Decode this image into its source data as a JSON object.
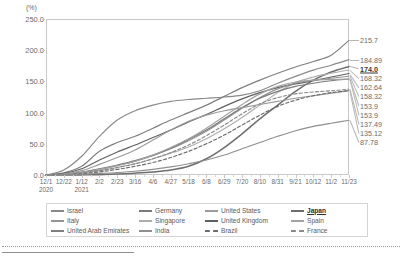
{
  "chart_data": {
    "type": "line",
    "title": "",
    "xlabel": "",
    "ylabel": "(%)",
    "yunit": "(%)",
    "ylim": [
      0,
      250
    ],
    "ytick_step": 50,
    "ytick_labels": [
      "250.0",
      "200.0",
      "150.0",
      "100.0",
      "50.0",
      "0.0"
    ],
    "ytick_values": [
      250,
      200,
      150,
      100,
      50,
      0
    ],
    "grid": false,
    "legend_position": "bottom",
    "x_start_year": "2020",
    "x_second_year": "2021",
    "x": [
      "12/1",
      "12/22",
      "1/12",
      "2/2",
      "2/23",
      "3/16",
      "4/6",
      "4/27",
      "5/18",
      "6/8",
      "6/29",
      "7/20",
      "8/10",
      "8/31",
      "9/21",
      "10/12",
      "11/2",
      "11/23"
    ],
    "xtick_labels": [
      "12/1",
      "12/22",
      "1/12",
      "2/2",
      "2/23",
      "3/16",
      "4/6",
      "4/27",
      "5/18",
      "6/8",
      "6/29",
      "7/20",
      "8/10",
      "8/31",
      "9/21",
      "10/12",
      "11/2",
      "11/23"
    ],
    "year_labels": [
      {
        "label": "2020",
        "at": "12/1"
      },
      {
        "label": "2021",
        "at": "1/12"
      }
    ],
    "series": [
      {
        "name": "United Arab Emirates",
        "end_value": 215.7,
        "end_label": "215.7",
        "color": "#7f7f7f",
        "dash": false,
        "highlight": false,
        "values": [
          0.0,
          3.5,
          14.0,
          38.0,
          52.0,
          62.0,
          75.0,
          88.0,
          100.0,
          112.0,
          126.0,
          140.0,
          152.0,
          163.0,
          173.0,
          182.0,
          192.0,
          215.7
        ]
      },
      {
        "name": "Israel",
        "end_value": 184.89,
        "end_label": "184.89",
        "color": "#898989",
        "dash": false,
        "highlight": false,
        "values": [
          0.0,
          8.0,
          30.0,
          62.0,
          88.0,
          103.0,
          112.0,
          118.0,
          121.0,
          123.0,
          125.0,
          128.0,
          135.0,
          147.0,
          158.0,
          168.0,
          176.0,
          184.89
        ]
      },
      {
        "name": "Japan",
        "end_value": 174.0,
        "end_label": "174.0",
        "color": "#6e6e6e",
        "dash": false,
        "highlight": true,
        "values": [
          0.0,
          0.0,
          0.2,
          0.6,
          1.5,
          3.0,
          5.0,
          8.0,
          14.0,
          26.0,
          44.0,
          66.0,
          90.0,
          112.0,
          134.0,
          152.0,
          165.0,
          174.0
        ]
      },
      {
        "name": "Singapore",
        "end_value": 168.32,
        "end_label": "168.32",
        "color": "#adadad",
        "dash": false,
        "highlight": false,
        "values": [
          0.0,
          1.0,
          3.0,
          7.0,
          12.0,
          18.0,
          26.0,
          35.0,
          45.0,
          58.0,
          74.0,
          92.0,
          112.0,
          132.0,
          148.0,
          157.0,
          163.0,
          168.32
        ]
      },
      {
        "name": "United Kingdom",
        "end_value": 162.64,
        "end_label": "162.64",
        "color": "#5f5f5f",
        "dash": false,
        "highlight": false,
        "values": [
          0.0,
          2.5,
          10.0,
          24.0,
          37.0,
          48.0,
          60.0,
          72.0,
          85.0,
          97.0,
          110.0,
          122.0,
          132.0,
          140.0,
          146.0,
          151.0,
          157.0,
          162.64
        ]
      },
      {
        "name": "Italy",
        "end_value": 158.32,
        "end_label": "158.32",
        "color": "#949494",
        "dash": false,
        "highlight": false,
        "values": [
          0.0,
          1.0,
          4.0,
          9.0,
          15.0,
          22.0,
          31.0,
          42.0,
          55.0,
          70.0,
          88.0,
          107.0,
          124.0,
          138.0,
          147.0,
          152.0,
          155.0,
          158.32
        ]
      },
      {
        "name": "Germany",
        "end_value": 153.9,
        "end_label": "153.9",
        "color": "#7a7a7a",
        "dash": false,
        "highlight": false,
        "values": [
          0.0,
          1.2,
          4.5,
          10.0,
          16.0,
          23.0,
          32.0,
          43.0,
          57.0,
          72.0,
          90.0,
          108.0,
          123.0,
          134.0,
          142.0,
          147.0,
          151.0,
          153.9
        ]
      },
      {
        "name": "Spain",
        "end_value": 153.9,
        "end_label": "153.9",
        "color": "#a2a2a2",
        "dash": false,
        "highlight": false,
        "values": [
          0.0,
          1.0,
          4.0,
          9.0,
          15.0,
          22.0,
          32.0,
          44.0,
          58.0,
          75.0,
          94.0,
          113.0,
          130.0,
          142.0,
          149.0,
          152.0,
          153.0,
          153.9
        ]
      },
      {
        "name": "France",
        "end_value": 137.49,
        "end_label": "137.49",
        "color": "#8a8a8a",
        "dash": true,
        "highlight": false,
        "values": [
          0.0,
          0.8,
          3.0,
          7.0,
          12.0,
          18.0,
          26.0,
          36.0,
          48.0,
          63.0,
          80.0,
          98.0,
          114.0,
          124.0,
          130.0,
          133.0,
          135.0,
          137.49
        ]
      },
      {
        "name": "United States",
        "end_value": 135.12,
        "end_label": "135.12",
        "color": "#9b9b9b",
        "dash": false,
        "highlight": false,
        "values": [
          0.0,
          1.5,
          7.0,
          17.0,
          28.0,
          40.0,
          56.0,
          72.0,
          86.0,
          96.0,
          103.0,
          108.0,
          113.0,
          118.0,
          123.0,
          127.0,
          131.0,
          135.12
        ]
      },
      {
        "name": "Brazil",
        "end_value": 135.12,
        "end_label": "135.12",
        "color": "#6b6b6b",
        "dash": true,
        "highlight": false,
        "values": [
          0.0,
          0.5,
          2.0,
          5.0,
          9.0,
          14.0,
          20.0,
          28.0,
          38.0,
          50.0,
          64.0,
          80.0,
          96.0,
          110.0,
          120.0,
          127.0,
          132.0,
          135.12
        ]
      },
      {
        "name": "India",
        "end_value": 87.78,
        "end_label": "87.78",
        "color": "#8f8f8f",
        "dash": false,
        "highlight": false,
        "values": [
          0.0,
          0.3,
          1.2,
          2.5,
          4.0,
          6.0,
          9.0,
          13.0,
          18.0,
          24.0,
          32.0,
          42.0,
          52.0,
          62.0,
          71.0,
          78.0,
          83.0,
          87.78
        ]
      }
    ],
    "end_labels": [
      {
        "text": "215.7",
        "value": 215.7,
        "highlight": false
      },
      {
        "text": "184.89",
        "value": 184.89,
        "highlight": false
      },
      {
        "text": "174.0",
        "value": 174.0,
        "highlight": true
      },
      {
        "text": "168.32",
        "value": 168.32,
        "highlight": false
      },
      {
        "text": "162.64",
        "value": 162.64,
        "highlight": false
      },
      {
        "text": "158.32",
        "value": 158.32,
        "highlight": false
      },
      {
        "text": "153.9",
        "value": 153.9,
        "highlight": false
      },
      {
        "text": "153.9",
        "value": 153.9,
        "highlight": false
      },
      {
        "text": "137.49",
        "value": 137.49,
        "highlight": false
      },
      {
        "text": "135.12",
        "value": 135.12,
        "highlight": false
      },
      {
        "text": "87.78",
        "value": 87.78,
        "highlight": false
      }
    ],
    "legend": [
      {
        "label": "Israel",
        "color": "#898989",
        "dash": false,
        "highlight": false
      },
      {
        "label": "Germany",
        "color": "#7a7a7a",
        "dash": false,
        "highlight": false
      },
      {
        "label": "United States",
        "color": "#9b9b9b",
        "dash": false,
        "highlight": false
      },
      {
        "label": "Japan",
        "color": "#6e6e6e",
        "dash": false,
        "highlight": true
      },
      {
        "label": "Italy",
        "color": "#949494",
        "dash": false,
        "highlight": false
      },
      {
        "label": "Singapore",
        "color": "#adadad",
        "dash": false,
        "highlight": false
      },
      {
        "label": "United Kingdom",
        "color": "#5f5f5f",
        "dash": false,
        "highlight": false
      },
      {
        "label": "Spain",
        "color": "#a2a2a2",
        "dash": false,
        "highlight": false
      },
      {
        "label": "United Arab Emirates",
        "color": "#7f7f7f",
        "dash": false,
        "highlight": false
      },
      {
        "label": "India",
        "color": "#8f8f8f",
        "dash": false,
        "highlight": false
      },
      {
        "label": "Brazil",
        "color": "#6b6b6b",
        "dash": true,
        "highlight": false
      },
      {
        "label": "France",
        "color": "#8a8a8a",
        "dash": true,
        "highlight": false
      }
    ]
  }
}
